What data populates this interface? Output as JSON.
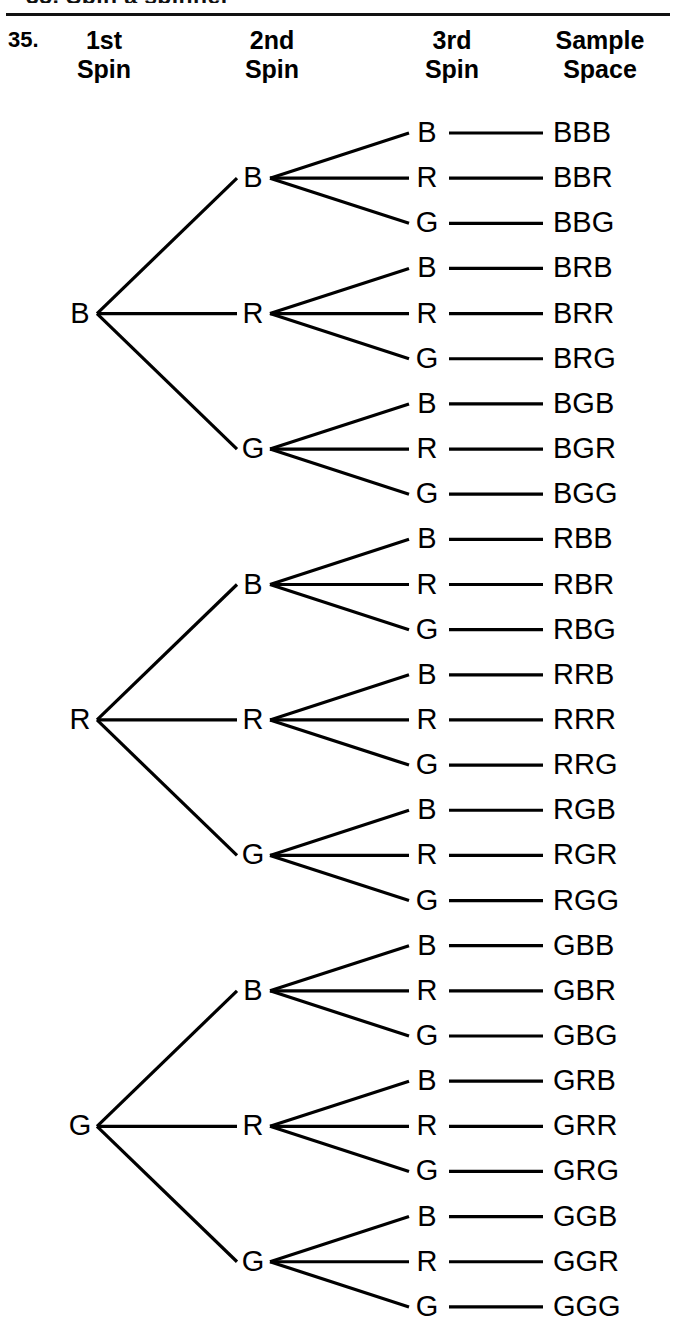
{
  "page": {
    "top_partial_text": "35.  Spin a spinner",
    "exercise_number": "35.",
    "width": 676,
    "height": 1339,
    "ink_color": "#000000",
    "background_color": "#ffffff"
  },
  "headers": [
    {
      "id": "first-spin",
      "label": "1st\nSpin"
    },
    {
      "id": "second-spin",
      "label": "2nd\nSpin"
    },
    {
      "id": "third-spin",
      "label": "3rd\nSpin"
    },
    {
      "id": "sample-space",
      "label": "Sample\nSpace"
    }
  ],
  "chart_data": {
    "type": "tree",
    "outcomes_per_spin": [
      "B",
      "R",
      "G"
    ],
    "levels": 3,
    "leaf_count": 27,
    "level1": [
      {
        "label": "B"
      },
      {
        "label": "R"
      },
      {
        "label": "G"
      }
    ],
    "level2": [
      {
        "label": "B"
      },
      {
        "label": "R"
      },
      {
        "label": "G"
      },
      {
        "label": "B"
      },
      {
        "label": "R"
      },
      {
        "label": "G"
      },
      {
        "label": "B"
      },
      {
        "label": "R"
      },
      {
        "label": "G"
      }
    ],
    "level3": [
      "B",
      "R",
      "G",
      "B",
      "R",
      "G",
      "B",
      "R",
      "G",
      "B",
      "R",
      "G",
      "B",
      "R",
      "G",
      "B",
      "R",
      "G",
      "B",
      "R",
      "G",
      "B",
      "R",
      "G",
      "B",
      "R",
      "G"
    ],
    "sample_space": [
      "BBB",
      "BBR",
      "BBG",
      "BRB",
      "BRR",
      "BRG",
      "BGB",
      "BGR",
      "BGG",
      "RBB",
      "RBR",
      "RBG",
      "RRB",
      "RRR",
      "RRG",
      "RGB",
      "RGR",
      "RGG",
      "GBB",
      "GBR",
      "GBG",
      "GRB",
      "GRR",
      "GRG",
      "GGB",
      "GGR",
      "GGG"
    ],
    "geometry": {
      "level1_x": 80,
      "level2_x": 253,
      "level3_x": 427,
      "sample_x": 553,
      "row_top_y": 133,
      "row_step_y": 45.15
    }
  }
}
